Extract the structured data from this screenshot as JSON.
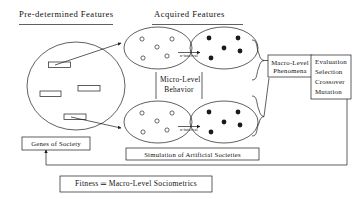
{
  "figure": {
    "headers": [
      {
        "label": "Pre-determined  Features"
      },
      {
        "label": "Acquired  Features"
      }
    ],
    "center_caption": {
      "line1": "Micro-Level",
      "line2": "Behavior"
    },
    "interval_labels": [
      {
        "label": "n-interval"
      },
      {
        "label": "n-interval"
      }
    ],
    "boxes": {
      "macro_level": {
        "line1": "Macro-Level",
        "line2": "Phenomena"
      },
      "ga_operators": {
        "items": [
          "Evaluation",
          "Selection",
          "Crossover",
          "Mutation"
        ]
      },
      "genes": {
        "label": "Genes  of  Society"
      },
      "simulation": {
        "label": "Simulation  of  Artificial  Societies"
      },
      "fitness": {
        "label": "Fitness ═ Macro-Level  Sociometrics"
      }
    },
    "populations": {
      "gene_pool": {
        "gene_count": 4
      },
      "micro_initial": {
        "agent_count": 5,
        "marker": "hollow-circle"
      },
      "micro_evolved": {
        "agent_count": 5,
        "marker": "filled-circle"
      }
    },
    "colors": {
      "stroke": "#1b1b1b",
      "background": "#ffffff",
      "text": "#111111"
    }
  }
}
